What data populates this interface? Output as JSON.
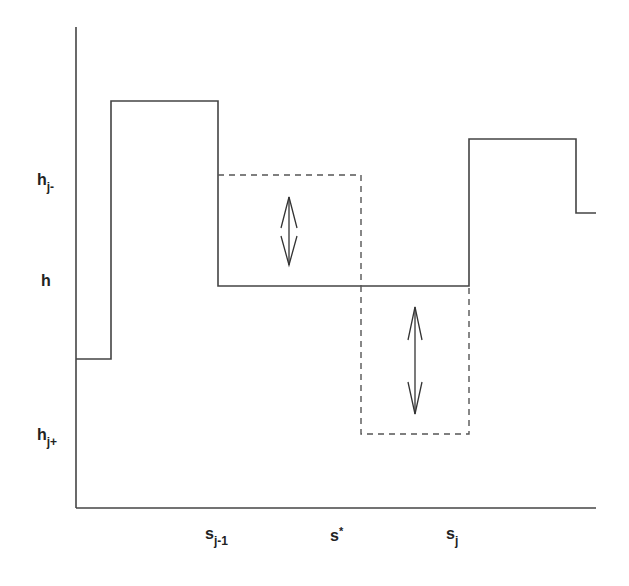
{
  "diagram": {
    "colors": {
      "line": "#444444",
      "dashed": "#555555",
      "background": "#ffffff"
    },
    "y_labels": [
      {
        "base": "h",
        "sub": "j-"
      },
      {
        "base": "h",
        "sub": ""
      },
      {
        "base": "h",
        "sub": "j+"
      }
    ],
    "x_labels": [
      {
        "base": "s",
        "sub": "j-1",
        "sup": ""
      },
      {
        "base": "s",
        "sub": "",
        "sup": "*"
      },
      {
        "base": "s",
        "sub": "j",
        "sup": ""
      }
    ],
    "solid_step_function": "piecewise-constant height profile h over s",
    "dashed_boxes": [
      "raise from h to h_j- on [s_{j-1}, s*]",
      "lower from h to h_j+ on [s*, s_j]"
    ],
    "arrows": [
      "double-arrow-upper",
      "double-arrow-lower"
    ]
  }
}
